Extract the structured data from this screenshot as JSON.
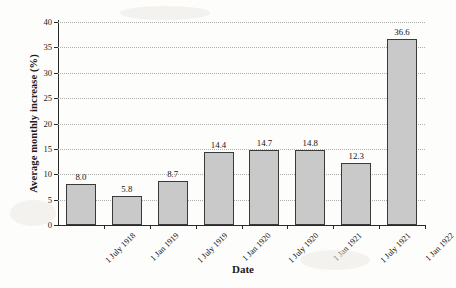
{
  "chart_data": {
    "type": "bar",
    "title": "",
    "xlabel": "Date",
    "ylabel": "Average monthly increase (%)",
    "categories": [
      "1 July 1918",
      "1 Jan 1919",
      "1 July 1919",
      "1 Jan 1920",
      "1 July 1920",
      "1 Jan 1921",
      "1 July 1921",
      "1 Jan 1922"
    ],
    "values": [
      8.0,
      5.8,
      8.7,
      14.4,
      14.7,
      14.8,
      12.3,
      36.6
    ],
    "value_labels": [
      "8.0",
      "5.8",
      "8.7",
      "14.4",
      "14.7",
      "14.8",
      "12.3",
      "36.6"
    ],
    "ylim": [
      0,
      40
    ],
    "ytick_labels": [
      "0",
      "5",
      "10",
      "15",
      "20",
      "25",
      "30",
      "35",
      "40"
    ],
    "ytick_values": [
      0,
      5,
      10,
      15,
      20,
      25,
      30,
      35,
      40
    ],
    "grid": true,
    "legend": null,
    "bar_color": "#c9c9c9",
    "bar_edge_color": "#3a3a3a",
    "gridline_color": "#aeb0ad",
    "axis_color": "#2a2a2a",
    "background_color": "#fdfdfb"
  }
}
